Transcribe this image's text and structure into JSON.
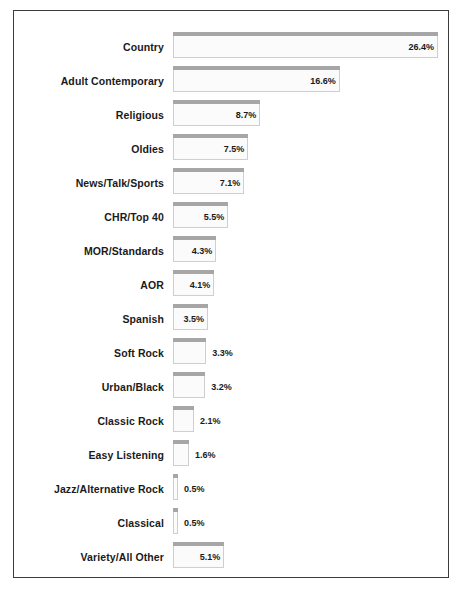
{
  "chart_data": {
    "type": "bar",
    "orientation": "horizontal",
    "title": "",
    "subtitle": "",
    "xlabel": "",
    "ylabel": "",
    "grid": false,
    "legend": null,
    "xlim": [
      0,
      26.4
    ],
    "value_suffix": "%",
    "categories": [
      "Country",
      "Adult Contemporary",
      "Religious",
      "Oldies",
      "News/Talk/Sports",
      "CHR/Top 40",
      "MOR/Standards",
      "AOR",
      "Spanish",
      "Soft Rock",
      "Urban/Black",
      "Classic Rock",
      "Easy Listening",
      "Jazz/Alternative Rock",
      "Classical",
      "Variety/All Other"
    ],
    "values": [
      26.4,
      16.6,
      8.7,
      7.5,
      7.1,
      5.5,
      4.3,
      4.1,
      3.5,
      3.3,
      3.2,
      2.1,
      1.6,
      0.5,
      0.5,
      5.1
    ],
    "value_labels": [
      "26.4%",
      "16.6%",
      "8.7%",
      "7.5%",
      "7.1%",
      "5.5%",
      "4.3%",
      "4.1%",
      "3.5%",
      "3.3%",
      "3.2%",
      "2.1%",
      "1.6%",
      "0.5%",
      "0.5%",
      "5.1%"
    ],
    "colors": {
      "bar_body": "#fbfbfb",
      "bar_outline": "#cfcfcf",
      "bar_cap": "#a6a6a6",
      "frame": "#3b3b3b",
      "background": "#ffffff",
      "label_text": "#1a1a1a"
    }
  },
  "layout": {
    "bar_origin_x": 159,
    "px_per_unit": 10.04,
    "row_height": 34,
    "first_row_top": 21,
    "label_inside_threshold": 3.4
  }
}
